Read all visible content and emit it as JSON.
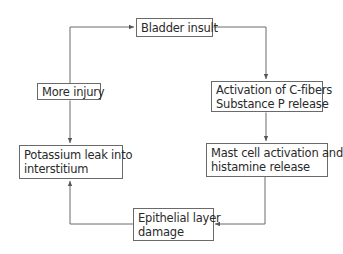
{
  "diagram": {
    "type": "cycle-flowchart",
    "nodes": [
      {
        "id": "bladder",
        "lines": [
          "Bladder insult"
        ]
      },
      {
        "id": "activation",
        "lines": [
          "Activation of C-fibers",
          "Substance P release"
        ]
      },
      {
        "id": "mast",
        "lines": [
          "Mast cell activation and",
          "histamine release"
        ]
      },
      {
        "id": "epithelial",
        "lines": [
          "Epithelial layer",
          "damage"
        ]
      },
      {
        "id": "potassium",
        "lines": [
          "Potassium leak into",
          "interstitium"
        ]
      },
      {
        "id": "injury",
        "lines": [
          "More injury"
        ]
      }
    ],
    "edges": [
      {
        "from": "bladder",
        "to": "activation",
        "style": "double-arrow"
      },
      {
        "from": "activation",
        "to": "mast",
        "style": "double-arrow"
      },
      {
        "from": "mast",
        "to": "epithelial",
        "style": "arrow"
      },
      {
        "from": "epithelial",
        "to": "potassium",
        "style": "arrow"
      },
      {
        "from": "potassium",
        "to": "injury",
        "style": "double-arrow"
      },
      {
        "from": "injury",
        "to": "bladder",
        "style": "arrow"
      }
    ],
    "colors": {
      "line": "#6a6a6a",
      "text": "#2a2a2a",
      "background": "#ffffff"
    }
  }
}
